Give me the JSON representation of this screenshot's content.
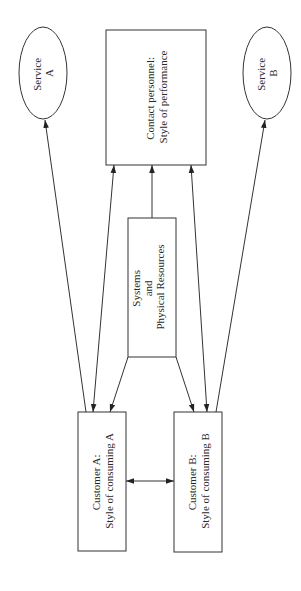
{
  "diagram": {
    "orientation": "rotated-90-ccw",
    "nodes": {
      "service_a": {
        "shape": "ellipse",
        "line1": "Service",
        "line2": "A"
      },
      "contact": {
        "shape": "rectangle",
        "line1": "Contact personnel:",
        "line2": "Style of performance"
      },
      "service_b": {
        "shape": "ellipse",
        "line1": "Service",
        "line2": "B"
      },
      "systems": {
        "shape": "rectangle",
        "line1": "Systems",
        "line2": "and",
        "line3": "Physical Resources"
      },
      "customer_a": {
        "shape": "rectangle",
        "line1": "Customer A:",
        "line2": "Style of consuming A"
      },
      "customer_b": {
        "shape": "rectangle",
        "line1": "Customer B:",
        "line2": "Style of consuming B"
      }
    },
    "edges": [
      {
        "from": "customer_a",
        "to": "service_a",
        "direction": "forward"
      },
      {
        "from": "customer_a",
        "to": "contact",
        "direction": "both"
      },
      {
        "from": "systems",
        "to": "customer_a",
        "direction": "forward"
      },
      {
        "from": "systems",
        "to": "contact",
        "direction": "forward"
      },
      {
        "from": "systems",
        "to": "customer_b",
        "direction": "forward"
      },
      {
        "from": "customer_b",
        "to": "contact",
        "direction": "both"
      },
      {
        "from": "customer_b",
        "to": "service_b",
        "direction": "forward"
      },
      {
        "from": "customer_a",
        "to": "customer_b",
        "direction": "both"
      }
    ],
    "colors": {
      "stroke": "#333333",
      "fill": "#ffffff",
      "text": "#2a2a2a"
    }
  }
}
